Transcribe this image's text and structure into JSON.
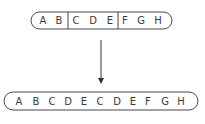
{
  "diagram": {
    "type": "sequence-duplication",
    "colors": {
      "stroke": "#333333",
      "text": "#3a3a3a",
      "background": "#ffffff"
    },
    "top_sequence": {
      "segments": [
        {
          "letters": [
            "A",
            "B"
          ]
        },
        {
          "letters": [
            "C",
            "D",
            "E"
          ]
        },
        {
          "letters": [
            "F",
            "G",
            "H"
          ]
        }
      ],
      "letters": [
        "A",
        "B",
        "C",
        "D",
        "E",
        "F",
        "G",
        "H"
      ]
    },
    "arrow": {
      "direction": "down"
    },
    "bottom_sequence": {
      "letters": [
        "A",
        "B",
        "C",
        "D",
        "E",
        "C",
        "D",
        "E",
        "F",
        "G",
        "H"
      ]
    }
  }
}
